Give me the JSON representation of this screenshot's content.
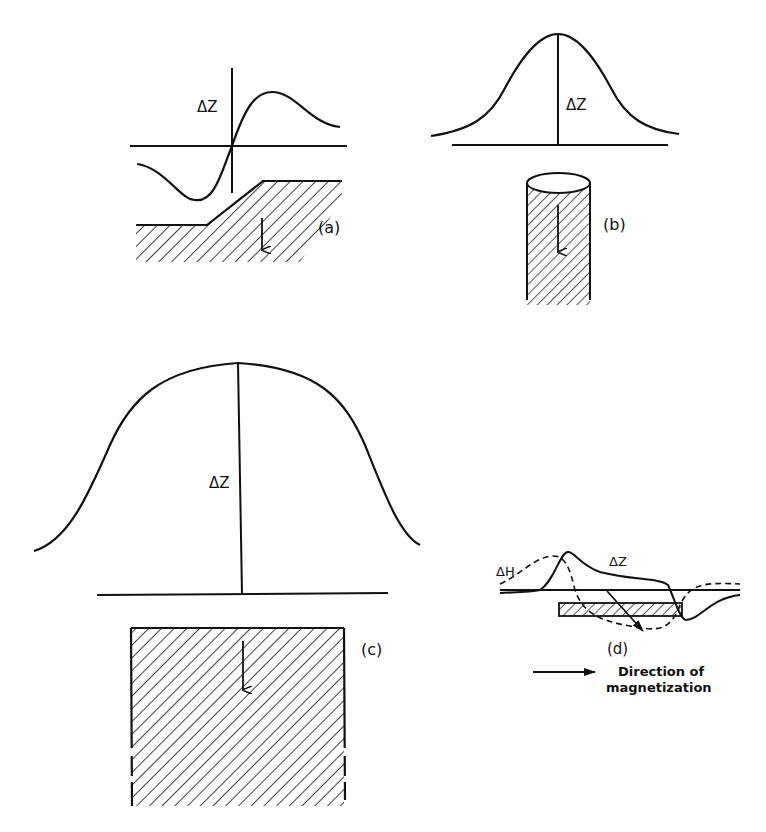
{
  "diagram": {
    "background": "#ffffff",
    "ink": "#111111",
    "panels": {
      "a": {
        "label": "(a)",
        "curve_label": "ΔZ",
        "body": "sloping step (fault-like) body, hatched",
        "magnetization_arrow": "down"
      },
      "b": {
        "label": "(b)",
        "curve_label": "ΔZ",
        "body": "vertical cylinder, hatched",
        "magnetization_arrow": "down"
      },
      "c": {
        "label": "(c)",
        "curve_label": "ΔZ",
        "body": "wide block, hatched",
        "magnetization_arrow": "down"
      },
      "d": {
        "label": "(d)",
        "curve_labels": [
          "ΔH",
          "ΔZ"
        ],
        "body": "thin horizontal sheet, hatched",
        "legend_arrow_text_line1": "Direction of",
        "legend_arrow_text_line2": "magnetization"
      }
    }
  }
}
